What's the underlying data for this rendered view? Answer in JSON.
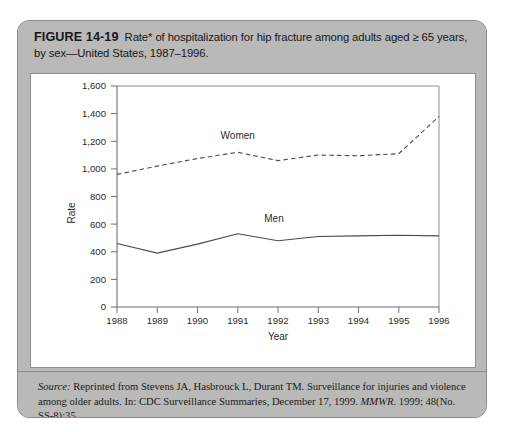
{
  "figure": {
    "number_label": "FIGURE 14-19",
    "caption": "Rate* of hospitalization for hip fracture among adults aged ≥ 65 years, by sex—United States, 1987–1996.",
    "footnote": "*Per 100,000 population.",
    "source_label": "Source:",
    "source_line1": " Reprinted from Stevens JA, Hasbrouck L, Durant TM. Surveillance for injuries and violence among",
    "source_line2_pre": "older adults. In: CDC Surveillance Summaries, December 17, 1999. ",
    "source_journal": "MMWR",
    "source_line2_post": ". 1999; 48(No. SS-8):35"
  },
  "chart_data": {
    "type": "line",
    "title": "",
    "xlabel": "Year",
    "ylabel": "Rate",
    "x": [
      1988,
      1989,
      1990,
      1991,
      1992,
      1993,
      1994,
      1995,
      1996
    ],
    "xtick_labels": [
      "1988",
      "1989",
      "1990",
      "1991",
      "1992",
      "1993",
      "1994",
      "1995",
      "1996"
    ],
    "ytick_labels": [
      "0",
      "200",
      "400",
      "600",
      "800",
      "1,000",
      "1,200",
      "1,400",
      "1,600"
    ],
    "ytick_values": [
      0,
      200,
      400,
      600,
      800,
      1000,
      1200,
      1400,
      1600
    ],
    "ylim": [
      0,
      1600
    ],
    "xlim": [
      1988,
      1996
    ],
    "grid": false,
    "legend": "inline-labels",
    "series": [
      {
        "name": "Women",
        "style": "dashed",
        "color": "#4a4a4c",
        "label_x": 1991.0,
        "label_y": 1215,
        "values": [
          960,
          1020,
          1075,
          1120,
          1060,
          1100,
          1095,
          1110,
          1380
        ]
      },
      {
        "name": "Men",
        "style": "solid",
        "color": "#4a4a4c",
        "label_x": 1991.9,
        "label_y": 615,
        "values": [
          460,
          390,
          455,
          530,
          480,
          510,
          515,
          520,
          515
        ]
      }
    ]
  }
}
